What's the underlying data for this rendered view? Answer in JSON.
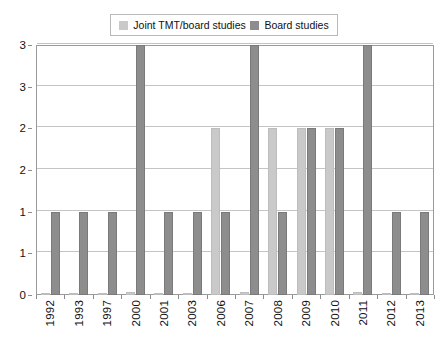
{
  "chart_data": {
    "type": "bar",
    "title": "",
    "xlabel": "",
    "ylabel": "",
    "ylim": [
      0,
      3
    ],
    "grid": true,
    "legend_position": "top-center",
    "categories": [
      "1992",
      "1993",
      "1997",
      "2000",
      "2001",
      "2003",
      "2006",
      "2007",
      "2008",
      "2009",
      "2010",
      "2011",
      "2012",
      "2013"
    ],
    "y_ticks": [
      0,
      0.5,
      1,
      1.5,
      2,
      2.5,
      3
    ],
    "y_tick_labels": [
      "0",
      "1",
      "1",
      "2",
      "2",
      "3",
      "3"
    ],
    "series": [
      {
        "name": "Joint TMT/board studies",
        "color": "#c9c9c9",
        "values": [
          0,
          0,
          0,
          0.04,
          0,
          0,
          2,
          0.04,
          2,
          2,
          2,
          0.04,
          0,
          0
        ]
      },
      {
        "name": "Board studies",
        "color": "#8d8d8d",
        "values": [
          1,
          1,
          1,
          3,
          1,
          1,
          1,
          3,
          1,
          2,
          2,
          3,
          1,
          1
        ]
      }
    ]
  },
  "legend": {
    "entries": [
      {
        "label": "Joint TMT/board studies",
        "color": "#c9c9c9"
      },
      {
        "label": "Board studies",
        "color": "#8d8d8d"
      }
    ]
  }
}
